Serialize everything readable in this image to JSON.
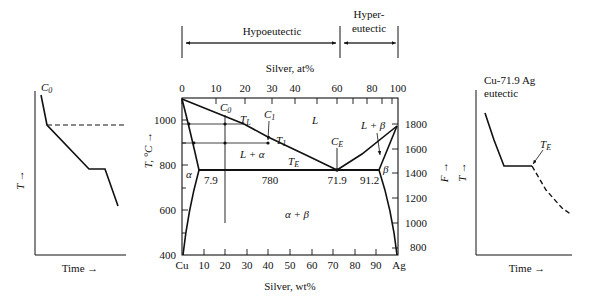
{
  "header": {
    "hypoeutectic_label": "Hypoeutectic",
    "hypereutectic_label_line1": "Hyper-",
    "hypereutectic_label_line2": "eutectic"
  },
  "left_cooling_curve": {
    "composition_label": "C",
    "composition_sub": "0",
    "y_axis_label": "T →",
    "x_axis_label": "Time →"
  },
  "right_cooling_curve": {
    "title_line1": "Cu-71.9 Ag",
    "title_line2": "eutectic",
    "y_axis_label": "T →",
    "x_axis_label": "Time →",
    "eutectic_label": "T",
    "eutectic_sub": "E"
  },
  "phase_diagram": {
    "top_axis_title": "Silver, at%",
    "top_ticks": [
      "0",
      "10",
      "20",
      "30",
      "40",
      "60",
      "80",
      "100"
    ],
    "bottom_axis_title": "Silver, wt%",
    "bottom_ticks": [
      "Cu",
      "10",
      "20",
      "30",
      "40",
      "50",
      "60",
      "70",
      "80",
      "90",
      "Ag"
    ],
    "left_axis_title": "T, °C →",
    "left_ticks": [
      "1000",
      "800",
      "600",
      "400"
    ],
    "right_axis_title": "F →",
    "right_ticks": [
      "1800",
      "1600",
      "1400",
      "1200",
      "1000",
      "800"
    ],
    "labels": {
      "C0": "C",
      "C0_sub": "0",
      "C1": "C",
      "C1_sub": "1",
      "TL": "T",
      "TL_sub": "L",
      "T1": "T",
      "T1_sub": "1",
      "TE": "T",
      "TE_sub": "E",
      "CE": "C",
      "CE_sub": "E",
      "L": "L",
      "L_alpha": "L + α",
      "L_beta": "L + β",
      "alpha": "α",
      "beta": "β",
      "alpha_beta": "α + β",
      "alpha_limit": "7.9",
      "eutectic_temp": "780",
      "eutectic_comp": "71.9",
      "beta_limit": "91.2"
    }
  }
}
